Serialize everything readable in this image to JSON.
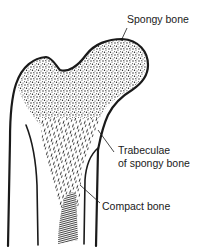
{
  "figure": {
    "labels": {
      "spongy_bone": "Spongy bone",
      "trabeculae_line1": "Trabeculae",
      "trabeculae_line2": "of spongy bone",
      "compact_bone": "Compact bone"
    },
    "colors": {
      "ink": "#1a1a1a",
      "background": "#ffffff"
    }
  }
}
